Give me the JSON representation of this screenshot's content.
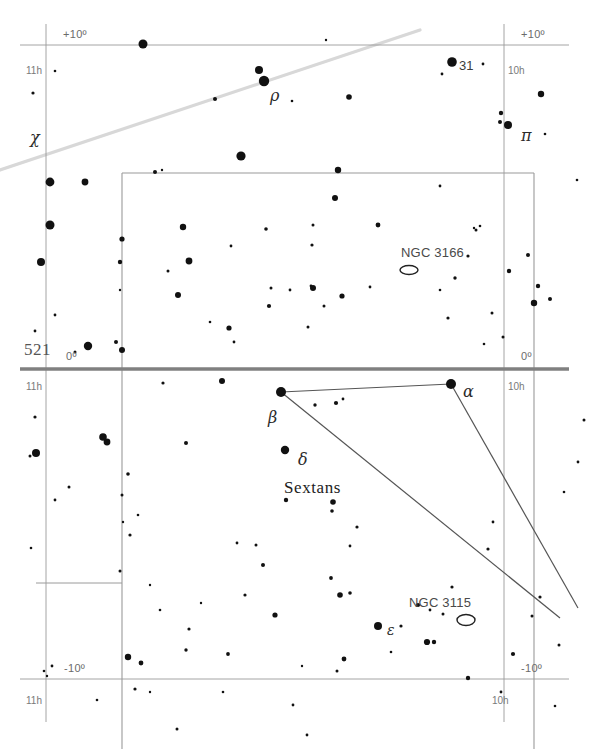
{
  "page": {
    "page_number": "521",
    "constellation": "Sextans",
    "background_color": "#ffffff",
    "grid_color": "#9a9a9a",
    "equator_color": "#808080",
    "ecliptic_color": "#d8d8d8",
    "star_color": "#111111",
    "constellation_line_color": "#555555"
  },
  "axis_labels": {
    "dec_plus10_left": "+10º",
    "dec_plus10_right": "+10º",
    "dec_zero_left": "0º",
    "dec_zero_right": "0º",
    "dec_minus10_left": "-10º",
    "dec_minus10_right": "-10º",
    "ra_11h_top": "11h",
    "ra_11h_mid": "11h",
    "ra_11h_bottom": "11h",
    "ra_10h_top": "10h",
    "ra_10h_mid": "10h",
    "ra_10h_bottom": "10h"
  },
  "star_labels": [
    {
      "text": "χ",
      "x": 30,
      "y": 128,
      "cls": "greek"
    },
    {
      "text": "ρ",
      "x": 270,
      "y": 86,
      "cls": "greek"
    },
    {
      "text": "31",
      "x": 459,
      "y": 58,
      "cls": "starname"
    },
    {
      "text": "π",
      "x": 521,
      "y": 126,
      "cls": "greek"
    },
    {
      "text": "α",
      "x": 463,
      "y": 382,
      "cls": "greek"
    },
    {
      "text": "β",
      "x": 268,
      "y": 408,
      "cls": "greek"
    },
    {
      "text": "δ",
      "x": 298,
      "y": 450,
      "cls": "greek"
    },
    {
      "text": "ε",
      "x": 387,
      "y": 622,
      "cls": "greek greek-sm"
    }
  ],
  "constellation_label": {
    "text": "Sextans",
    "x": 284,
    "y": 478
  },
  "deep_sky_objects": [
    {
      "name": "NGC 3166",
      "label_x": 401,
      "label_y": 245,
      "sym_x": 409,
      "sym_y": 270,
      "rx": 9,
      "ry": 4.5
    },
    {
      "name": "NGC 3115",
      "label_x": 409,
      "label_y": 595,
      "sym_x": 466,
      "sym_y": 620,
      "rx": 9,
      "ry": 5.5
    }
  ],
  "chart_data": {
    "type": "scatter",
    "xlabel": "Right Ascension",
    "ylabel": "Declination",
    "xlim": [
      "11h",
      "10h"
    ],
    "ylim": [
      "-10º",
      "+10º"
    ],
    "grid": true,
    "legend": "none",
    "note": "Star marker radius encodes apparent magnitude; larger = brighter.",
    "grid_lines": {
      "ra_hour_x": [
        46,
        504
      ],
      "dec_plus10_y": 45,
      "dec_zero_y": 369,
      "dec_minus10_y": 679,
      "frame_left_x": 122,
      "frame_right_x": 534,
      "frame_top_y": 173,
      "inner_bottom_left_y": 583
    },
    "ecliptic": {
      "x1": 0,
      "y1": 170,
      "x2": 420,
      "y2": 30
    },
    "constellation_lines": [
      {
        "from": [
          281,
          392
        ],
        "to": [
          451,
          384
        ]
      },
      {
        "from": [
          451,
          384
        ],
        "to": [
          578,
          608
        ]
      },
      {
        "from": [
          281,
          392
        ],
        "to": [
          560,
          618
        ]
      }
    ],
    "stars": [
      {
        "x": 143,
        "y": 44,
        "r": 4.5
      },
      {
        "x": 55,
        "y": 71,
        "r": 1.3
      },
      {
        "x": 33,
        "y": 93,
        "r": 1.6
      },
      {
        "x": 326,
        "y": 40,
        "r": 1.2
      },
      {
        "x": 452,
        "y": 62,
        "r": 4.8
      },
      {
        "x": 483,
        "y": 64,
        "r": 1.4
      },
      {
        "x": 259,
        "y": 70,
        "r": 4.0
      },
      {
        "x": 442,
        "y": 74,
        "r": 1.4
      },
      {
        "x": 541,
        "y": 94,
        "r": 3.2
      },
      {
        "x": 264,
        "y": 81,
        "r": 5.2
      },
      {
        "x": 349,
        "y": 97,
        "r": 2.8
      },
      {
        "x": 501,
        "y": 113,
        "r": 2.2
      },
      {
        "x": 500,
        "y": 122,
        "r": 2.0
      },
      {
        "x": 292,
        "y": 101,
        "r": 1.3
      },
      {
        "x": 215,
        "y": 99,
        "r": 2.0
      },
      {
        "x": 508,
        "y": 125,
        "r": 4.0
      },
      {
        "x": 545,
        "y": 134,
        "r": 1.3
      },
      {
        "x": 50,
        "y": 182,
        "r": 4.4
      },
      {
        "x": 85,
        "y": 182,
        "r": 3.4
      },
      {
        "x": 241,
        "y": 156,
        "r": 4.6
      },
      {
        "x": 155,
        "y": 172,
        "r": 2.0
      },
      {
        "x": 162,
        "y": 170,
        "r": 1.2
      },
      {
        "x": 338,
        "y": 170,
        "r": 3.2
      },
      {
        "x": 440,
        "y": 186,
        "r": 1.4
      },
      {
        "x": 577,
        "y": 180,
        "r": 1.3
      },
      {
        "x": 335,
        "y": 198,
        "r": 3.0
      },
      {
        "x": 183,
        "y": 227,
        "r": 3.2
      },
      {
        "x": 266,
        "y": 229,
        "r": 1.8
      },
      {
        "x": 313,
        "y": 225,
        "r": 1.5
      },
      {
        "x": 312,
        "y": 245,
        "r": 1.6
      },
      {
        "x": 50,
        "y": 225,
        "r": 4.5
      },
      {
        "x": 41,
        "y": 262,
        "r": 4.0
      },
      {
        "x": 120,
        "y": 262,
        "r": 2.2
      },
      {
        "x": 189,
        "y": 261,
        "r": 3.4
      },
      {
        "x": 168,
        "y": 271,
        "r": 1.5
      },
      {
        "x": 178,
        "y": 295,
        "r": 3.0
      },
      {
        "x": 271,
        "y": 288,
        "r": 1.5
      },
      {
        "x": 269,
        "y": 306,
        "r": 2.1
      },
      {
        "x": 370,
        "y": 287,
        "r": 1.4
      },
      {
        "x": 476,
        "y": 230,
        "r": 1.5
      },
      {
        "x": 474,
        "y": 228,
        "r": 1.2
      },
      {
        "x": 480,
        "y": 226,
        "r": 1.3
      },
      {
        "x": 313,
        "y": 288,
        "r": 3.0
      },
      {
        "x": 311,
        "y": 286,
        "r": 1.4
      },
      {
        "x": 290,
        "y": 290,
        "r": 1.4
      },
      {
        "x": 342,
        "y": 296,
        "r": 2.6
      },
      {
        "x": 324,
        "y": 306,
        "r": 1.5
      },
      {
        "x": 308,
        "y": 327,
        "r": 1.5
      },
      {
        "x": 509,
        "y": 271,
        "r": 2.2
      },
      {
        "x": 528,
        "y": 255,
        "r": 2.0
      },
      {
        "x": 538,
        "y": 286,
        "r": 2.2
      },
      {
        "x": 550,
        "y": 299,
        "r": 2.0
      },
      {
        "x": 492,
        "y": 313,
        "r": 1.5
      },
      {
        "x": 448,
        "y": 318,
        "r": 1.6
      },
      {
        "x": 440,
        "y": 290,
        "r": 1.3
      },
      {
        "x": 120,
        "y": 290,
        "r": 1.2
      },
      {
        "x": 55,
        "y": 315,
        "r": 1.4
      },
      {
        "x": 35,
        "y": 331,
        "r": 1.4
      },
      {
        "x": 88,
        "y": 346,
        "r": 4.2
      },
      {
        "x": 116,
        "y": 342,
        "r": 2.0
      },
      {
        "x": 75,
        "y": 352,
        "r": 1.5
      },
      {
        "x": 234,
        "y": 342,
        "r": 1.4
      },
      {
        "x": 229,
        "y": 328,
        "r": 2.6
      },
      {
        "x": 163,
        "y": 383,
        "r": 1.6
      },
      {
        "x": 222,
        "y": 381,
        "r": 3.0
      },
      {
        "x": 35,
        "y": 417,
        "r": 1.6
      },
      {
        "x": 103,
        "y": 437,
        "r": 3.8
      },
      {
        "x": 107,
        "y": 442,
        "r": 3.4
      },
      {
        "x": 36,
        "y": 453,
        "r": 4.0
      },
      {
        "x": 30,
        "y": 456,
        "r": 1.5
      },
      {
        "x": 281,
        "y": 392,
        "r": 5.0
      },
      {
        "x": 451,
        "y": 384,
        "r": 5.0
      },
      {
        "x": 484,
        "y": 344,
        "r": 1.3
      },
      {
        "x": 503,
        "y": 337,
        "r": 1.5
      },
      {
        "x": 315,
        "y": 405,
        "r": 1.7
      },
      {
        "x": 336,
        "y": 403,
        "r": 2.1
      },
      {
        "x": 343,
        "y": 399,
        "r": 1.4
      },
      {
        "x": 285,
        "y": 450,
        "r": 4.2
      },
      {
        "x": 186,
        "y": 443,
        "r": 2.0
      },
      {
        "x": 128,
        "y": 474,
        "r": 1.8
      },
      {
        "x": 286,
        "y": 500,
        "r": 2.2
      },
      {
        "x": 332,
        "y": 511,
        "r": 1.8
      },
      {
        "x": 333,
        "y": 502,
        "r": 2.8
      },
      {
        "x": 357,
        "y": 527,
        "r": 1.6
      },
      {
        "x": 130,
        "y": 535,
        "r": 1.6
      },
      {
        "x": 237,
        "y": 543,
        "r": 1.4
      },
      {
        "x": 256,
        "y": 545,
        "r": 1.5
      },
      {
        "x": 350,
        "y": 546,
        "r": 1.4
      },
      {
        "x": 263,
        "y": 565,
        "r": 2.0
      },
      {
        "x": 331,
        "y": 578,
        "r": 1.9
      },
      {
        "x": 245,
        "y": 595,
        "r": 1.6
      },
      {
        "x": 340,
        "y": 595,
        "r": 2.8
      },
      {
        "x": 350,
        "y": 593,
        "r": 1.8
      },
      {
        "x": 189,
        "y": 629,
        "r": 1.6
      },
      {
        "x": 275,
        "y": 615,
        "r": 2.6
      },
      {
        "x": 186,
        "y": 650,
        "r": 1.7
      },
      {
        "x": 228,
        "y": 654,
        "r": 1.9
      },
      {
        "x": 337,
        "y": 671,
        "r": 1.5
      },
      {
        "x": 344,
        "y": 659,
        "r": 2.4
      },
      {
        "x": 378,
        "y": 626,
        "r": 4.0
      },
      {
        "x": 401,
        "y": 626,
        "r": 1.6
      },
      {
        "x": 427,
        "y": 642,
        "r": 3.1
      },
      {
        "x": 434,
        "y": 642,
        "r": 2.2
      },
      {
        "x": 418,
        "y": 605,
        "r": 2.1
      },
      {
        "x": 430,
        "y": 610,
        "r": 1.4
      },
      {
        "x": 452,
        "y": 587,
        "r": 1.6
      },
      {
        "x": 443,
        "y": 614,
        "r": 1.5
      },
      {
        "x": 488,
        "y": 549,
        "r": 1.6
      },
      {
        "x": 493,
        "y": 522,
        "r": 1.4
      },
      {
        "x": 540,
        "y": 597,
        "r": 1.6
      },
      {
        "x": 532,
        "y": 616,
        "r": 1.5
      },
      {
        "x": 513,
        "y": 654,
        "r": 2.1
      },
      {
        "x": 559,
        "y": 645,
        "r": 1.5
      },
      {
        "x": 468,
        "y": 678,
        "r": 2.2
      },
      {
        "x": 501,
        "y": 692,
        "r": 1.4
      },
      {
        "x": 555,
        "y": 706,
        "r": 1.3
      },
      {
        "x": 391,
        "y": 652,
        "r": 1.3
      },
      {
        "x": 223,
        "y": 692,
        "r": 1.3
      },
      {
        "x": 150,
        "y": 692,
        "r": 1.2
      },
      {
        "x": 47,
        "y": 676,
        "r": 1.2
      },
      {
        "x": 135,
        "y": 689,
        "r": 1.6
      },
      {
        "x": 52,
        "y": 666,
        "r": 1.4
      },
      {
        "x": 44,
        "y": 671,
        "r": 1.3
      },
      {
        "x": 302,
        "y": 666,
        "r": 1.2
      },
      {
        "x": 293,
        "y": 705,
        "r": 1.4
      },
      {
        "x": 177,
        "y": 729,
        "r": 1.5
      },
      {
        "x": 307,
        "y": 735,
        "r": 1.4
      },
      {
        "x": 128,
        "y": 657,
        "r": 3.2
      },
      {
        "x": 141,
        "y": 663,
        "r": 2.4
      },
      {
        "x": 160,
        "y": 610,
        "r": 1.3
      },
      {
        "x": 120,
        "y": 571,
        "r": 1.5
      },
      {
        "x": 150,
        "y": 585,
        "r": 1.2
      },
      {
        "x": 138,
        "y": 515,
        "r": 1.3
      },
      {
        "x": 55,
        "y": 500,
        "r": 1.4
      },
      {
        "x": 69,
        "y": 487,
        "r": 1.5
      },
      {
        "x": 122,
        "y": 495,
        "r": 1.5
      },
      {
        "x": 123,
        "y": 522,
        "r": 1.2
      },
      {
        "x": 31,
        "y": 548,
        "r": 1.3
      },
      {
        "x": 97,
        "y": 700,
        "r": 1.3
      },
      {
        "x": 201,
        "y": 603,
        "r": 1.2
      },
      {
        "x": 584,
        "y": 420,
        "r": 1.5
      },
      {
        "x": 578,
        "y": 462,
        "r": 1.4
      },
      {
        "x": 564,
        "y": 492,
        "r": 1.3
      },
      {
        "x": 122,
        "y": 239,
        "r": 2.6
      },
      {
        "x": 122,
        "y": 350,
        "r": 3.0
      },
      {
        "x": 534,
        "y": 303,
        "r": 3.2
      },
      {
        "x": 231,
        "y": 246,
        "r": 1.4
      },
      {
        "x": 210,
        "y": 322,
        "r": 1.3
      },
      {
        "x": 378,
        "y": 225,
        "r": 2.4
      },
      {
        "x": 455,
        "y": 278,
        "r": 1.7
      },
      {
        "x": 468,
        "y": 256,
        "r": 1.6
      }
    ]
  }
}
